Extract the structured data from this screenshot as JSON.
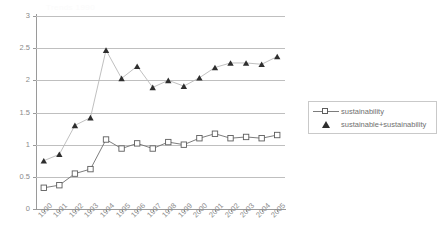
{
  "faint_title": "Trends 1990",
  "chart_data": {
    "type": "line",
    "title": "",
    "xlabel": "",
    "ylabel": "",
    "grid": true,
    "legend_position": "right",
    "ylim": [
      0,
      3
    ],
    "yticks": [
      "0",
      "0.5",
      "1",
      "1.5",
      "2",
      "2.5",
      "3"
    ],
    "ytick_values": [
      0,
      0.5,
      1,
      1.5,
      2,
      2.5,
      3
    ],
    "categories": [
      "1990",
      "1991",
      "1992",
      "1993",
      "1994",
      "1995",
      "1996",
      "1997",
      "1998",
      "1999",
      "2000",
      "2001",
      "2002",
      "2003",
      "2004",
      "2005"
    ],
    "series": [
      {
        "name": "sustainability",
        "marker": "square",
        "color": "#5d5d5d",
        "values": [
          0.33,
          0.37,
          0.55,
          0.62,
          1.08,
          0.94,
          1.02,
          0.94,
          1.04,
          1.0,
          1.1,
          1.17,
          1.1,
          1.12,
          1.1,
          1.15
        ]
      },
      {
        "name": "sustainable+sustainability",
        "marker": "triangle",
        "color": "#2e2e2e",
        "values": [
          0.75,
          0.85,
          1.3,
          1.42,
          2.47,
          2.03,
          2.22,
          1.89,
          2.0,
          1.91,
          2.04,
          2.2,
          2.27,
          2.27,
          2.25,
          2.37
        ]
      }
    ]
  },
  "legend": {
    "items": [
      {
        "label": "sustainability",
        "marker": "square"
      },
      {
        "label": "sustainable+sustainability",
        "marker": "triangle"
      }
    ]
  }
}
